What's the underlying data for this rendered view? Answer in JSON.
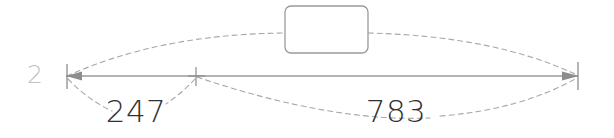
{
  "drawing": {
    "type": "dimension-annotation",
    "background_color": "#ffffff",
    "row_label": "2",
    "row_label_color": "#c2c2c2",
    "dimension_line": {
      "color": "#9a9a9a",
      "y": 76,
      "x_start": 66,
      "x_end": 578,
      "tick_x": 196
    },
    "segments": [
      {
        "name": "left-segment",
        "value": "247",
        "from_x": 66,
        "to_x": 196,
        "label_x": 136,
        "label_y": 122
      },
      {
        "name": "right-segment",
        "value": "783",
        "from_x": 196,
        "to_x": 578,
        "label_x": 396,
        "label_y": 122
      }
    ],
    "callout_box": {
      "name": "note-box",
      "text": "",
      "x": 285,
      "y": 6,
      "width": 83,
      "height": 47,
      "radius": 6,
      "stroke": "#9a9a9a",
      "fill": "#ffffff"
    },
    "arcs": {
      "stroke": "#a8a8a8",
      "dash": "5 4"
    }
  }
}
